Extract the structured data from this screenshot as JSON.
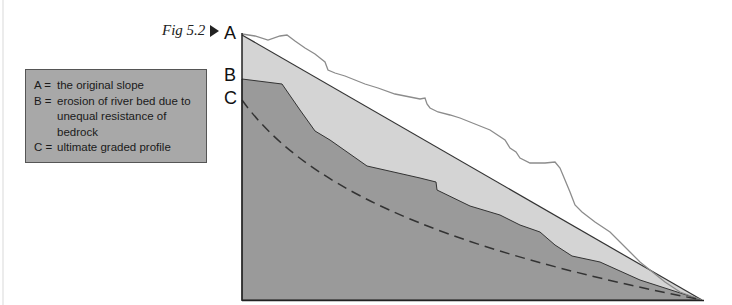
{
  "figure": {
    "caption": "Fig 5.2",
    "marker_icon": "right-triangle-arrow",
    "labels": {
      "a": "A",
      "b": "B",
      "c": "C"
    }
  },
  "legend": {
    "items": [
      {
        "key": "A =",
        "text": "the original slope"
      },
      {
        "key": "B =",
        "text": "erosion of river bed due to unequal resistance of bedrock"
      },
      {
        "key": "C =",
        "text": "ultimate graded profile"
      }
    ]
  },
  "colors": {
    "legend_bg": "#a8a8a8",
    "original_slope_fill": "#d4d4d4",
    "eroded_bed_fill": "#9a9a9a",
    "rough_surface_line": "#8c8c8c",
    "outline": "#333333",
    "dashed_profile": "#333333"
  }
}
